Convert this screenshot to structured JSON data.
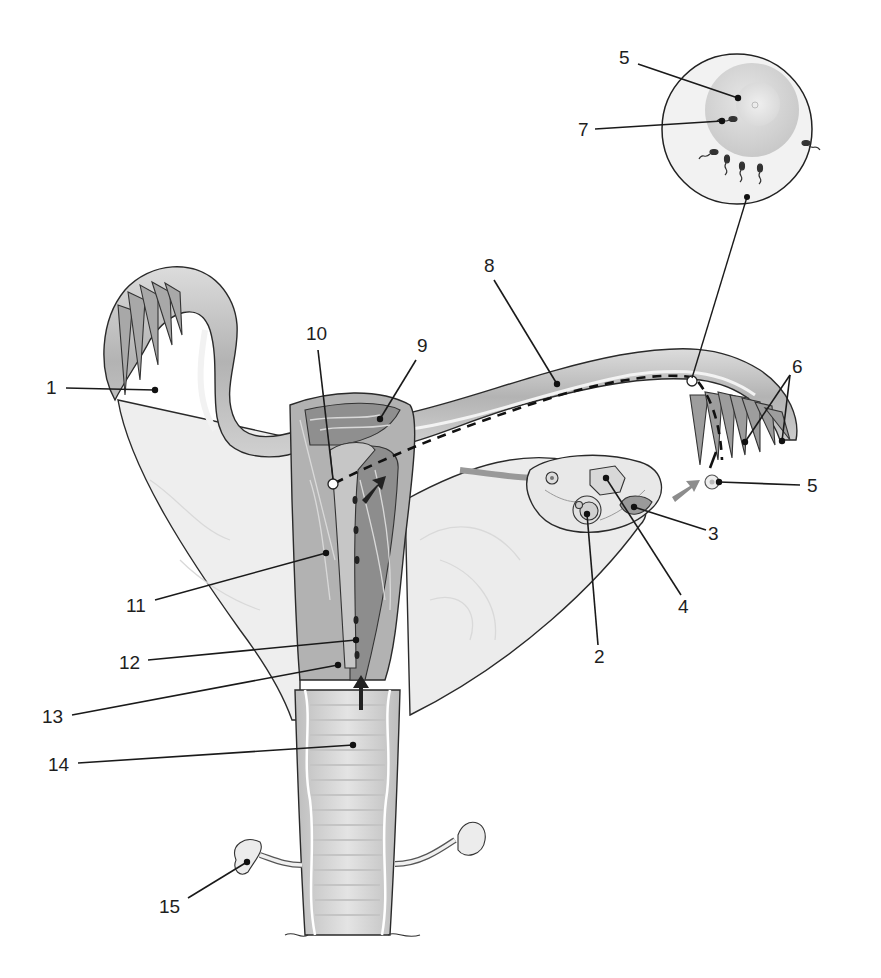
{
  "figure": {
    "type": "anatomical-diagram",
    "background": "#ffffff",
    "tones": {
      "ligament": "#e6e6e6",
      "ligament_light": "#f1f1f1",
      "tube_wall": "#c8c8c8",
      "tube_lumen": "#a9a9a9",
      "endometrium": "#8f8f8f",
      "myometrium": "#b4b4b4",
      "vagina_rugae": "#d2d2d2",
      "ovum_zona": "#efefef",
      "ovum_cytoplasm": "#d6d6d6",
      "arrow": "#222222",
      "arrow_grey": "#8c8c8c"
    }
  },
  "labels": [
    {
      "id": "1",
      "text": "1",
      "x": 46,
      "y": 394,
      "target": [
        155,
        390
      ]
    },
    {
      "id": "2",
      "text": "2",
      "x": 600,
      "y": 663,
      "target": [
        587,
        514
      ]
    },
    {
      "id": "3",
      "text": "3",
      "x": 708,
      "y": 538,
      "target": [
        634,
        507
      ]
    },
    {
      "id": "4",
      "text": "4",
      "x": 682,
      "y": 612,
      "target": [
        606,
        478
      ]
    },
    {
      "id": "5a",
      "text": "5",
      "x": 620,
      "y": 64,
      "target": [
        738,
        98
      ]
    },
    {
      "id": "5b",
      "text": "5",
      "x": 808,
      "y": 492,
      "target": [
        719,
        482
      ]
    },
    {
      "id": "6",
      "text": "6",
      "x": 792,
      "y": 372,
      "target_a": [
        745,
        442
      ],
      "target_b": [
        782,
        441
      ]
    },
    {
      "id": "7",
      "text": "7",
      "x": 579,
      "y": 135,
      "target": [
        722,
        121
      ]
    },
    {
      "id": "8",
      "text": "8",
      "x": 485,
      "y": 272,
      "target": [
        557,
        384
      ]
    },
    {
      "id": "9",
      "text": "9",
      "x": 418,
      "y": 352,
      "target": [
        380,
        419
      ]
    },
    {
      "id": "10",
      "text": "10",
      "x": 306,
      "y": 339,
      "target": [
        333,
        482
      ]
    },
    {
      "id": "11",
      "text": "11",
      "x": 127,
      "y": 612,
      "target": [
        326,
        553
      ]
    },
    {
      "id": "12",
      "text": "12",
      "x": 120,
      "y": 668,
      "target": [
        356,
        640
      ]
    },
    {
      "id": "13",
      "text": "13",
      "x": 42,
      "y": 722,
      "target": [
        338,
        665
      ]
    },
    {
      "id": "14",
      "text": "14",
      "x": 48,
      "y": 770,
      "target": [
        353,
        745
      ]
    },
    {
      "id": "15",
      "text": "15",
      "x": 160,
      "y": 913,
      "target": [
        247,
        862
      ]
    }
  ],
  "inset": {
    "name": "ovum-with-sperm",
    "center": [
      737,
      129
    ],
    "radius": 75,
    "connector_to": [
      692,
      382
    ]
  }
}
